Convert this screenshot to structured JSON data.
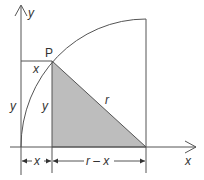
{
  "diagram": {
    "title": "",
    "colors": {
      "stroke": "#555555",
      "fill": "#bdbdbd",
      "text": "#333333"
    },
    "axes": {
      "x_label": "x",
      "y_label": "y"
    },
    "point": {
      "label": "P"
    },
    "labels": {
      "top_x": "x",
      "left_y": "y",
      "inner_y": "y",
      "hypotenuse": "r",
      "dim_x": "x",
      "dim_r_minus_x": "r – x"
    }
  }
}
